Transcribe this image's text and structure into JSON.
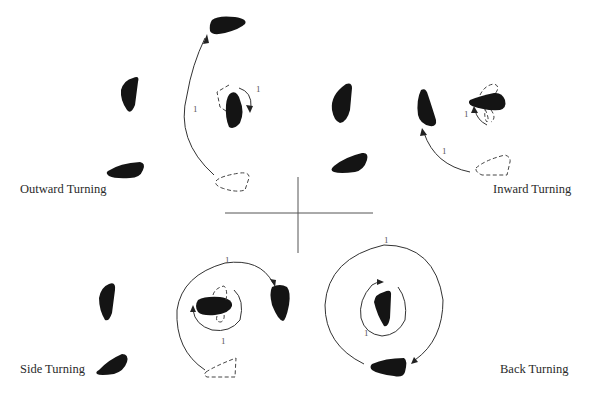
{
  "figure": {
    "quadrants": [
      {
        "id": "outward",
        "label": "Outward Turning",
        "step_labels": [
          "1",
          "1"
        ]
      },
      {
        "id": "inward",
        "label": "Inward Turning",
        "step_labels": [
          "1",
          "1"
        ]
      },
      {
        "id": "side",
        "label": "Side Turning",
        "step_labels": [
          "1",
          "1"
        ]
      },
      {
        "id": "back",
        "label": "Back Turning",
        "step_labels": [
          "1",
          "1"
        ]
      }
    ],
    "colors": {
      "figure_fill": "#141414",
      "line": "#333333",
      "dashed_outline": "#444444",
      "background": "#ffffff"
    }
  }
}
